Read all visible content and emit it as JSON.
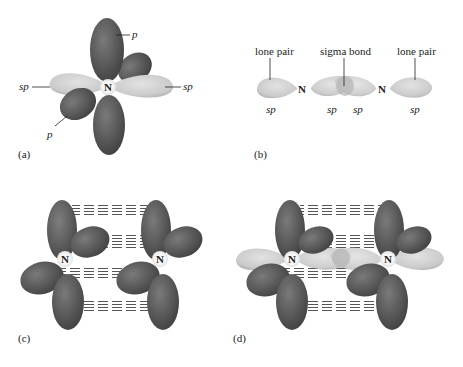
{
  "figure": {
    "panels": [
      {
        "id": "a",
        "label": "(a)",
        "atom": "N",
        "orbital_labels": {
          "p_top": "p",
          "p_bottom": "p",
          "sp_left": "sp",
          "sp_right": "sp"
        }
      },
      {
        "id": "b",
        "label": "(b)",
        "atoms": [
          "N",
          "N"
        ],
        "annotations": {
          "lone_pair_left": "lone pair",
          "sigma_bond": "sigma bond",
          "lone_pair_right": "lone pair"
        },
        "orbital_labels": [
          "sp",
          "sp",
          "sp",
          "sp"
        ]
      },
      {
        "id": "c",
        "label": "(c)",
        "atoms": [
          "N",
          "N"
        ]
      },
      {
        "id": "d",
        "label": "(d)",
        "atoms": [
          "N",
          "N"
        ]
      }
    ],
    "colors": {
      "p_orbital": "#5a5a5a",
      "sp_orbital": "#c9c9c9",
      "atom_halo": "#f2f2f2",
      "pi_dash": "#666666"
    }
  }
}
